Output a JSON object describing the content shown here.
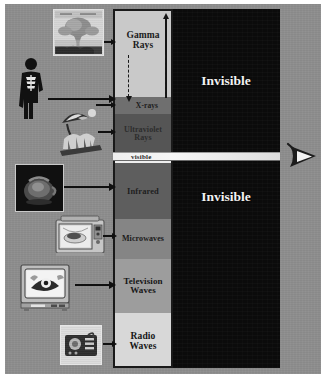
{
  "diagram": {
    "title": "Electromagnetic Spectrum",
    "background_color": "#8e8e8e",
    "invisible_panel_color": "#0b0b0b"
  },
  "spectrum": {
    "bands": [
      {
        "id": "gamma",
        "label": "Gamma\nRays",
        "label_line1": "Gamma",
        "label_line2": "Rays",
        "color": "#c9c9c9",
        "text_color": "#1b1b1b",
        "font_size": 9.5,
        "height_pct": 24.0
      },
      {
        "id": "xrays",
        "label": "X-rays",
        "label_line1": "X-rays",
        "label_line2": "",
        "color": "#6f6f6f",
        "text_color": "#1b1b1b",
        "font_size": 7.5,
        "height_pct": 4.8
      },
      {
        "id": "ultraviolet",
        "label": "Ultraviolet\nRays",
        "label_line1": "Ultraviolet",
        "label_line2": "Rays",
        "color": "#555555",
        "text_color": "#2a2a2a",
        "font_size": 8.0,
        "height_pct": 11.2
      },
      {
        "id": "visible",
        "label": "visible",
        "label_line1": "visible",
        "label_line2": "",
        "color": "#efefef",
        "text_color": "#2a2a2a",
        "font_size": 7.0,
        "height_pct": 2.5
      },
      {
        "id": "infrared",
        "label": "Infrared",
        "label_line1": "Infrared",
        "label_line2": "",
        "color": "#5e5e5e",
        "text_color": "#1e1e1e",
        "font_size": 8.5,
        "height_pct": 15.6
      },
      {
        "id": "microwaves",
        "label": "Microwaves",
        "label_line1": "Microwaves",
        "label_line2": "",
        "color": "#858585",
        "text_color": "#1b1b1b",
        "font_size": 8.0,
        "height_pct": 11.2
      },
      {
        "id": "television",
        "label": "Television\nWaves",
        "label_line1": "Television",
        "label_line2": "Waves",
        "color": "#9d9d9d",
        "text_color": "#161616",
        "font_size": 9.0,
        "height_pct": 15.0
      },
      {
        "id": "radio",
        "label": "Radio\nWaves",
        "label_line1": "Radio",
        "label_line2": "Waves",
        "color": "#d8d8d8",
        "text_color": "#161616",
        "font_size": 9.5,
        "height_pct": 15.7
      }
    ]
  },
  "invisible_regions": [
    {
      "id": "invisible-upper",
      "label": "Invisible"
    },
    {
      "id": "invisible-lower",
      "label": "Invisible"
    }
  ],
  "sources": [
    {
      "id": "nuclear-explosion",
      "alt": "Nuclear explosion mushroom cloud photo",
      "band": "gamma"
    },
    {
      "id": "human-xray-figure",
      "alt": "Human figure showing skeleton",
      "band": "xrays"
    },
    {
      "id": "beach-umbrella",
      "alt": "Beach scene with umbrella and sun",
      "band": "ultraviolet"
    },
    {
      "id": "thermal-kettle",
      "alt": "Thermal infrared image of kettle",
      "band": "infrared"
    },
    {
      "id": "microwave-oven",
      "alt": "Microwave oven with food",
      "band": "microwaves"
    },
    {
      "id": "television-set",
      "alt": "Television set showing cartoon",
      "band": "television"
    },
    {
      "id": "radio-receiver",
      "alt": "Radio receiver",
      "band": "radio"
    }
  ],
  "eye": {
    "id": "eye-icon",
    "alt": "Human eye viewing visible light"
  }
}
